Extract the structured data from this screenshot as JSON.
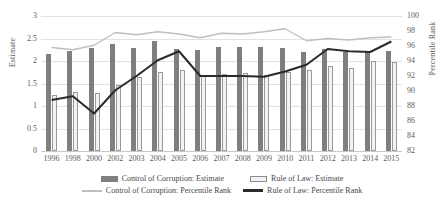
{
  "chart_data": {
    "type": "bar",
    "title": "",
    "xlabel": "",
    "ylabel": "Estimate",
    "y2label": "Percentile Rank",
    "grid": true,
    "legend_position": "bottom",
    "ylim": [
      0,
      3
    ],
    "y2lim": [
      82,
      100
    ],
    "yticks": [
      "3",
      "2.5",
      "2",
      "1.5",
      "1",
      "0.5",
      "0"
    ],
    "y2ticks": [
      "100",
      "98",
      "96",
      "94",
      "92",
      "90",
      "88",
      "86",
      "84",
      "82"
    ],
    "categories": [
      "1996",
      "1998",
      "2000",
      "2002",
      "2003",
      "2004",
      "2005",
      "2006",
      "2007",
      "2008",
      "2009",
      "2010",
      "2011",
      "2012",
      "2013",
      "2014",
      "2015"
    ],
    "series": [
      {
        "name": "Control of Corruption: Estimate",
        "type": "bar",
        "axis": "left",
        "color": "#7f7f7f",
        "values": [
          2.16,
          2.22,
          2.29,
          2.37,
          2.28,
          2.44,
          2.26,
          2.24,
          2.31,
          2.32,
          2.32,
          2.29,
          2.2,
          2.26,
          2.19,
          2.21,
          2.23
        ]
      },
      {
        "name": "Rule of Law: Estimate",
        "type": "bar",
        "axis": "left",
        "color": "#f2f2f2",
        "values": [
          1.25,
          1.31,
          1.29,
          1.46,
          1.64,
          1.76,
          1.81,
          1.68,
          1.71,
          1.73,
          1.68,
          1.76,
          1.81,
          1.88,
          1.84,
          1.99,
          1.98
        ]
      },
      {
        "name": "Control of Corruption: Percentile Rank",
        "type": "line",
        "axis": "right",
        "color": "#bfbfbf",
        "values": [
          95.8,
          95.5,
          96.1,
          97.8,
          97.5,
          97.9,
          97.6,
          97.1,
          97.7,
          97.6,
          97.9,
          98.3,
          96.7,
          97.0,
          96.8,
          97.1,
          97.2
        ]
      },
      {
        "name": "Rule of Law: Percentile Rank",
        "type": "line",
        "axis": "right",
        "color": "#2b2b2b",
        "values": [
          88.8,
          89.3,
          87.0,
          90.1,
          92.0,
          94.1,
          95.3,
          92.0,
          92.0,
          92.0,
          91.9,
          92.6,
          93.5,
          95.6,
          95.3,
          95.2,
          96.6
        ]
      }
    ]
  },
  "legend": {
    "items": [
      {
        "label": "Control of Corruption: Estimate",
        "marker": "bar-dark"
      },
      {
        "label": "Rule of Law: Estimate",
        "marker": "bar-light"
      },
      {
        "label": "Control of Corruption: Percentile Rank",
        "marker": "line-light"
      },
      {
        "label": "Rule of Law: Percentile Rank",
        "marker": "line-dark"
      }
    ]
  }
}
